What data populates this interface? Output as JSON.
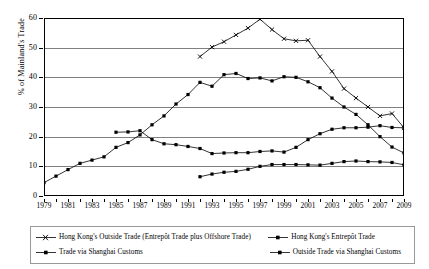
{
  "chart_data": {
    "type": "line",
    "title": "",
    "xlabel": "",
    "ylabel": "% of Mainland's Trade",
    "ylim": [
      0,
      60
    ],
    "xlim": [
      1979,
      2009
    ],
    "ytick_labels": [
      "0",
      "10",
      "20",
      "30",
      "40",
      "50",
      "60"
    ],
    "ytick_values": [
      0,
      10,
      20,
      30,
      40,
      50,
      60
    ],
    "xtick_labels": [
      "1979",
      "1981",
      "1983",
      "1985",
      "1987",
      "1989",
      "1991",
      "1993",
      "1995",
      "1997",
      "1999",
      "2001",
      "2003",
      "2005",
      "2007",
      "2009"
    ],
    "xtick_values": [
      1979,
      1981,
      1983,
      1985,
      1987,
      1989,
      1991,
      1993,
      1995,
      1997,
      1999,
      2001,
      2003,
      2005,
      2007,
      2009
    ],
    "grid": true,
    "legend_position": "bottom",
    "series": [
      {
        "name": "Hong Kong's Outside Trade (Entrepôt Trade plus Offshore Trade)",
        "marker": "x",
        "x": [
          1992,
          1993,
          1994,
          1995,
          1996,
          1997,
          1998,
          1999,
          2000,
          2001,
          2002,
          2003,
          2004,
          2005,
          2006,
          2007,
          2008,
          2009
        ],
        "values": [
          47.0,
          50.2,
          52.0,
          54.3,
          56.6,
          59.6,
          56.1,
          53.0,
          52.3,
          52.5,
          47.0,
          42.0,
          36.2,
          33.0,
          30.0,
          27.0,
          27.8,
          23.0
        ]
      },
      {
        "name": "Hong Kong's Entrepôt Trade",
        "marker": "square",
        "x": [
          1979,
          1980,
          1981,
          1982,
          1983,
          1984,
          1985,
          1986,
          1987,
          1988,
          1989,
          1990,
          1991,
          1992,
          1993,
          1994,
          1995,
          1996,
          1997,
          1998,
          1999,
          2000,
          2001,
          2002,
          2003,
          2004,
          2005,
          2006,
          2007,
          2008,
          2009
        ],
        "values": [
          4.5,
          6.7,
          8.9,
          11.0,
          12.1,
          13.2,
          16.4,
          18.0,
          20.6,
          24.0,
          27.0,
          31.0,
          34.2,
          38.3,
          37.0,
          40.9,
          41.3,
          39.6,
          39.8,
          38.8,
          40.2,
          40.0,
          38.5,
          36.5,
          33.0,
          30.0,
          27.5,
          24.0,
          20.0,
          16.5,
          14.5
        ]
      },
      {
        "name": "Trade via Shanghai Customs",
        "marker": "square",
        "x": [
          1985,
          1986,
          1987,
          1988,
          1989,
          1990,
          1991,
          1992,
          1993,
          1994,
          1995,
          1996,
          1997,
          1998,
          1999,
          2000,
          2001,
          2002,
          2003,
          2004,
          2005,
          2006,
          2007,
          2008,
          2009
        ],
        "values": [
          21.5,
          21.6,
          22.0,
          19.0,
          17.6,
          17.3,
          16.7,
          16.0,
          14.3,
          14.5,
          14.6,
          14.6,
          15.0,
          15.2,
          14.8,
          16.4,
          19.0,
          21.0,
          22.5,
          23.0,
          23.0,
          23.2,
          23.7,
          23.1,
          23.0
        ]
      },
      {
        "name": "Outside Trade via Shanghai Customs",
        "marker": "square",
        "x": [
          1992,
          1993,
          1994,
          1995,
          1996,
          1997,
          1998,
          1999,
          2000,
          2001,
          2002,
          2003,
          2004,
          2005,
          2006,
          2007,
          2008,
          2009
        ],
        "values": [
          6.5,
          7.4,
          8.0,
          8.3,
          9.0,
          10.0,
          10.6,
          10.6,
          10.6,
          10.5,
          10.4,
          11.0,
          11.6,
          11.8,
          11.6,
          11.5,
          11.3,
          10.5
        ]
      }
    ]
  },
  "legend": {
    "entries": [
      {
        "label": "Hong Kong's Outside Trade (Entrepôt Trade plus Offshore Trade)",
        "marker": "x"
      },
      {
        "label": "Hong Kong's Entrepôt Trade",
        "marker": "square"
      },
      {
        "label": "Trade via Shanghai Customs",
        "marker": "square"
      },
      {
        "label": "Outside Trade via Shanghai Customs",
        "marker": "square"
      }
    ]
  },
  "colors": {
    "series_line": "#000000",
    "gridline": "#808080",
    "frame": "#000000",
    "background": "#ffffff"
  }
}
